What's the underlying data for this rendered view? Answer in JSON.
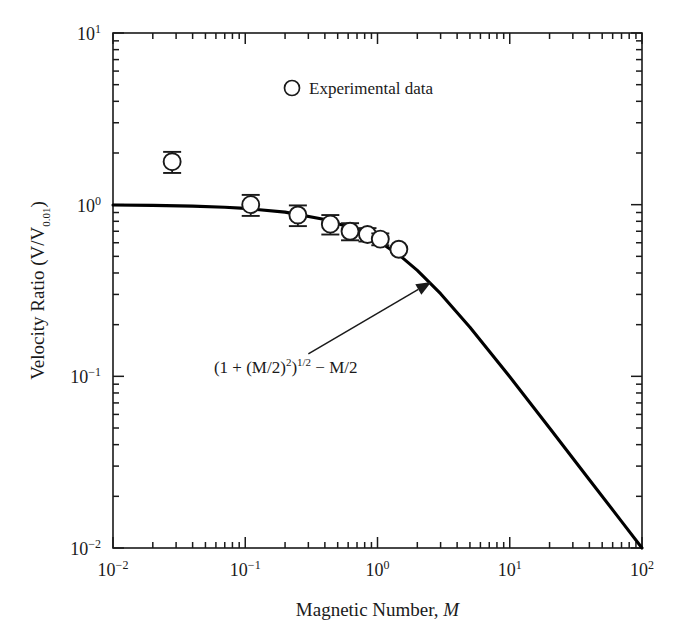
{
  "figure": {
    "background_color": "#ffffff",
    "ink_color": "#1a1a1a",
    "curve_color": "#000000",
    "marker_fill": "#ffffff"
  },
  "chart_data": {
    "type": "line",
    "title": "",
    "subtitle": "",
    "xlabel": "Magnetic Number, M",
    "xlabel_plain": "Magnetic Number,",
    "xlabel_italic_symbol": "M",
    "ylabel": "Velocity Ratio (V/V0.01)",
    "ylabel_plain": "Velocity Ratio (V/V",
    "ylabel_subscript": "0.01",
    "ylabel_tail": ")",
    "xscale": "log",
    "yscale": "log",
    "xlim": [
      0.01,
      100
    ],
    "ylim": [
      0.01,
      10
    ],
    "grid": false,
    "x_tick_labels": [
      "10-2",
      "10-1",
      "100",
      "101",
      "102"
    ],
    "x_tick_mantissas": [
      "10",
      "10",
      "10",
      "10",
      "10"
    ],
    "x_tick_exponents": [
      "-2",
      "-1",
      "0",
      "1",
      "2"
    ],
    "x_tick_values": [
      0.01,
      0.1,
      1,
      10,
      100
    ],
    "y_tick_labels": [
      "101",
      "100",
      "10-1",
      "10-2"
    ],
    "y_tick_mantissas": [
      "10",
      "10",
      "10",
      "10"
    ],
    "y_tick_exponents": [
      "1",
      "0",
      "-1",
      "-2"
    ],
    "y_tick_values": [
      10,
      1,
      0.1,
      0.01
    ],
    "minor_tick_multipliers": [
      2,
      3,
      4,
      5,
      6,
      7,
      8,
      9
    ],
    "legend": {
      "position": "inside-top-center",
      "entries": [
        {
          "label": "Experimental data",
          "marker": "open-circle"
        }
      ]
    },
    "annotations": [
      {
        "name": "model-equation",
        "text": "(1 + (M/2)2)1/2 - M/2",
        "parts": {
          "lead": "(1 + (M/2)",
          "sup1": "2",
          "mid": ")",
          "sup2": "1/2",
          "tail": " − M/2"
        },
        "text_x": 0.058,
        "text_y": 0.105,
        "arrow_from_x": 0.3,
        "arrow_from_y": 0.135,
        "arrow_to_x": 2.55,
        "arrow_to_y": 0.355
      }
    ],
    "series": [
      {
        "name": "Experimental data",
        "type": "scatter-with-errorbars",
        "marker": "open-circle",
        "x": [
          0.028,
          0.11,
          0.25,
          0.44,
          0.62,
          0.84,
          1.05,
          1.45
        ],
        "y": [
          1.78,
          1.0,
          0.87,
          0.77,
          0.7,
          0.67,
          0.63,
          0.55
        ],
        "yerr_low": [
          0.25,
          0.14,
          0.12,
          0.1,
          0.08,
          0.06,
          0.05,
          0.0
        ],
        "yerr_high": [
          0.25,
          0.14,
          0.12,
          0.1,
          0.08,
          0.06,
          0.05,
          0.0
        ]
      },
      {
        "name": "Model curve",
        "type": "line",
        "formula": "(1 + (M/2)^2)^(1/2) - M/2",
        "x": [
          0.01,
          0.02,
          0.04,
          0.07,
          0.1,
          0.2,
          0.4,
          0.7,
          1.0,
          1.5,
          2.0,
          3.0,
          5.0,
          7.0,
          10.0,
          20.0,
          40.0,
          70.0,
          100.0
        ],
        "y": [
          0.995,
          0.99,
          0.98,
          0.966,
          0.951,
          0.905,
          0.82,
          0.715,
          0.618,
          0.5,
          0.414,
          0.303,
          0.193,
          0.14,
          0.0995,
          0.05,
          0.025,
          0.0143,
          0.01
        ]
      }
    ]
  }
}
